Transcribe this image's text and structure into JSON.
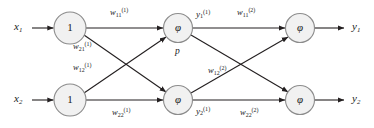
{
  "figure": {
    "type": "neural-network-diagram",
    "background_color": "#ffffff",
    "line_color": "#231f20",
    "node_fill": "#f1f1f1",
    "node_stroke": "#8c8c8c"
  },
  "inputs": [
    {
      "name": "input-x1",
      "base": "x",
      "sub": "1"
    },
    {
      "name": "input-x2",
      "base": "x",
      "sub": "2"
    }
  ],
  "bias_nodes": [
    {
      "name": "bias-node-top",
      "label": "1"
    },
    {
      "name": "bias-node-bottom",
      "label": "1"
    }
  ],
  "hidden_nodes": [
    {
      "name": "hidden-node-top",
      "label": "φ"
    },
    {
      "name": "hidden-node-bottom",
      "label": "φ"
    }
  ],
  "output_nodes": [
    {
      "name": "output-node-top",
      "label": "φ"
    },
    {
      "name": "output-node-bottom",
      "label": "φ"
    }
  ],
  "layer1_weights": [
    {
      "name": "weight-w11-layer1",
      "base": "w",
      "sub": "11",
      "sup": "(1)"
    },
    {
      "name": "weight-w21-layer1",
      "base": "w",
      "sub": "21",
      "sup": "(1)"
    },
    {
      "name": "weight-w12-layer1",
      "base": "w",
      "sub": "12",
      "sup": "(1)"
    },
    {
      "name": "weight-w22-layer1",
      "base": "w",
      "sub": "22",
      "sup": "(1)"
    }
  ],
  "layer2_weights": [
    {
      "name": "weight-w11-layer2",
      "base": "w",
      "sub": "11",
      "sup": "(2)"
    },
    {
      "name": "weight-w12-layer2",
      "base": "w",
      "sub": "12",
      "sup": "(2)"
    },
    {
      "name": "weight-w22-layer2",
      "base": "w",
      "sub": "22",
      "sup": "(2)"
    }
  ],
  "hidden_outputs": [
    {
      "name": "hidden-output-y1",
      "base": "y",
      "sub": "1",
      "sup": "(1)"
    },
    {
      "name": "hidden-output-y2",
      "base": "y",
      "sub": "2",
      "sup": "(1)"
    }
  ],
  "annotations": [
    {
      "name": "annotation-p",
      "text": "p"
    }
  ],
  "outputs": [
    {
      "name": "output-y1",
      "base": "y",
      "sub": "1"
    },
    {
      "name": "output-y2",
      "base": "y",
      "sub": "2"
    }
  ]
}
